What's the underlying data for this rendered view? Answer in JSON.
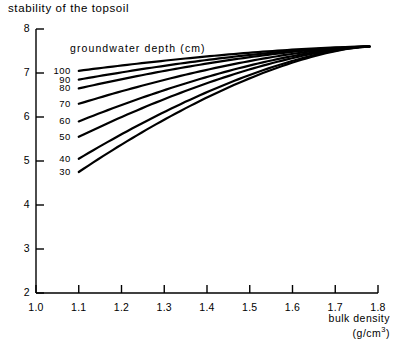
{
  "figure": {
    "title": "stability of the topsoil",
    "xaxis_title_line1": "bulk density",
    "xaxis_title_line2": "(g/cm",
    "xaxis_title_sup": "3",
    "xaxis_title_line2_end": ")",
    "legend_title": "groundwater depth (cm)"
  },
  "chart_data": {
    "type": "line",
    "title": "stability of the topsoil",
    "xlabel": "bulk density (g/cm3)",
    "ylabel": "stability of the topsoil",
    "xlim": [
      1.0,
      1.8
    ],
    "ylim": [
      2,
      8
    ],
    "xticks": [
      "1.0",
      "1.1",
      "1.2",
      "1.3",
      "1.4",
      "1.5",
      "1.6",
      "1.7",
      "1.8"
    ],
    "xtick_values": [
      1.0,
      1.1,
      1.2,
      1.3,
      1.4,
      1.5,
      1.6,
      1.7,
      1.8
    ],
    "yticks": [
      "2",
      "3",
      "4",
      "5",
      "6",
      "7",
      "8"
    ],
    "ytick_values": [
      2,
      3,
      4,
      5,
      6,
      7,
      8
    ],
    "grid": false,
    "legend_position": "inside-upper-left",
    "legend_title": "groundwater depth (cm)",
    "series_label_unit": "cm",
    "series": [
      {
        "name": "100",
        "label": "100",
        "x": [
          1.1,
          1.78
        ],
        "values": [
          7.05,
          7.6
        ]
      },
      {
        "name": "90",
        "label": "90",
        "x": [
          1.1,
          1.78
        ],
        "values": [
          6.85,
          7.6
        ]
      },
      {
        "name": "80",
        "label": "80",
        "x": [
          1.1,
          1.78
        ],
        "values": [
          6.65,
          7.6
        ]
      },
      {
        "name": "70",
        "label": "70",
        "x": [
          1.1,
          1.78
        ],
        "values": [
          6.3,
          7.6
        ]
      },
      {
        "name": "60",
        "label": "60",
        "x": [
          1.1,
          1.78
        ],
        "values": [
          5.9,
          7.6
        ]
      },
      {
        "name": "50",
        "label": "50",
        "x": [
          1.1,
          1.78
        ],
        "values": [
          5.55,
          7.6
        ]
      },
      {
        "name": "40",
        "label": "40",
        "x": [
          1.1,
          1.78
        ],
        "values": [
          5.05,
          7.6
        ]
      },
      {
        "name": "30",
        "label": "30",
        "x": [
          1.1,
          1.78
        ],
        "values": [
          4.75,
          7.6
        ]
      }
    ],
    "line_color": "#000000"
  }
}
